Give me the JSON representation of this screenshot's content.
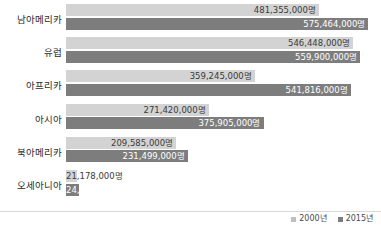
{
  "chart_data": {
    "type": "bar",
    "orientation": "horizontal",
    "title": "",
    "xlabel": "",
    "ylabel": "",
    "unit_suffix": "명",
    "categories": [
      "남아메리카",
      "유럽",
      "아프리카",
      "아시아",
      "북아메리카",
      "오세아니아"
    ],
    "series": [
      {
        "name": "2000년",
        "color": "#d3d3d3",
        "values": [
          481355000,
          546448000,
          359245000,
          271420000,
          209585000,
          21178000
        ],
        "labels": [
          "481,355,000명",
          "546,448,000명",
          "359,245,000명",
          "271,420,000명",
          "209,585,000명",
          "21,178,000명"
        ]
      },
      {
        "name": "2015년",
        "color": "#7d7d7d",
        "values": [
          575464000,
          559900000,
          541816000,
          375905000,
          231499000,
          24892000
        ],
        "labels": [
          "575,464,000명",
          "559,900,000명",
          "541,816,000명",
          "375,905,000명",
          "231,499,000명",
          "24,892,000명"
        ]
      }
    ],
    "xlim": [
      0,
      590000000
    ],
    "grid": false,
    "legend_position": "bottom-right"
  },
  "legend": {
    "items": [
      {
        "label": "2000년",
        "color": "#d3d3d3"
      },
      {
        "label": "2015년",
        "color": "#7d7d7d"
      }
    ]
  }
}
